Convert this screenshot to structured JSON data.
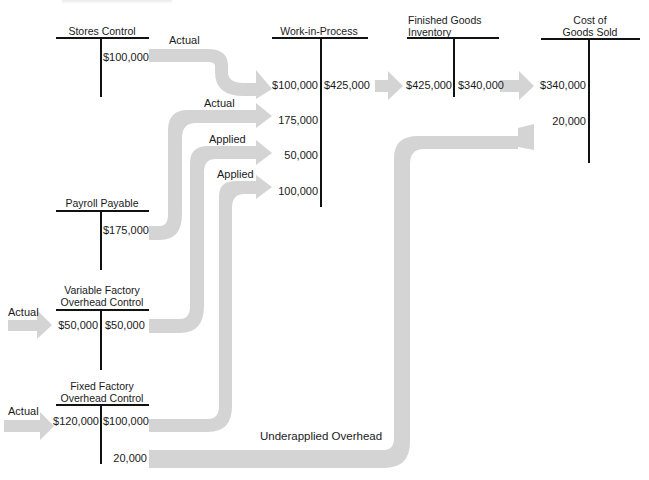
{
  "diagram": {
    "type": "t-account-flow",
    "arrow_color": "#d4d4d4",
    "line_color": "#111111",
    "accounts": [
      {
        "id": "stores_control",
        "title": "Stores Control",
        "debits": [],
        "credits": [
          "$100,000"
        ]
      },
      {
        "id": "payroll_payable",
        "title": "Payroll Payable",
        "debits": [],
        "credits": [
          "$175,000"
        ]
      },
      {
        "id": "variable_foh",
        "title_line1": "Variable Factory",
        "title_line2": "Overhead Control",
        "debits": [
          "$50,000"
        ],
        "credits": [
          "$50,000"
        ]
      },
      {
        "id": "fixed_foh",
        "title_line1": "Fixed Factory",
        "title_line2": "Overhead Control",
        "debits": [
          "$120,000"
        ],
        "credits": [
          "$100,000",
          "20,000"
        ]
      },
      {
        "id": "wip",
        "title": "Work-in-Process",
        "debits": [
          "$100,000",
          "175,000",
          "50,000",
          "100,000"
        ],
        "credits": [
          "$425,000"
        ]
      },
      {
        "id": "finished_goods",
        "title_line1": "Finished Goods",
        "title_line2": "Inventory",
        "debits": [
          "$425,000"
        ],
        "credits": [
          "$340,000"
        ]
      },
      {
        "id": "cogs",
        "title_line1": "Cost of",
        "title_line2": "Goods Sold",
        "debits": [
          "$340,000",
          "20,000"
        ],
        "credits": []
      }
    ],
    "flow_labels": {
      "stores_to_wip": "Actual",
      "payroll_to_wip": "Actual",
      "vfoh_to_wip": "Applied",
      "ffoh_to_wip": "Applied",
      "actual_into_vfoh": "Actual",
      "actual_into_ffoh": "Actual",
      "underapplied": "Underapplied Overhead"
    }
  }
}
